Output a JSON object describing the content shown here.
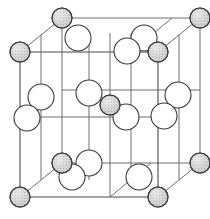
{
  "figure": {
    "title": "Rock-salt (NaCl-type) crystal unit cell",
    "projection": "oblique",
    "background_color": "#ffffff",
    "line_color": "#6e6e6e",
    "outline_color": "#3a3a3a",
    "shaded_atom_fill": "#b5b5b5",
    "open_atom_fill": "#ffffff"
  },
  "chart_data": {
    "type": "scatter",
    "title": "Rock-salt (NaCl-type) crystal unit cell",
    "xlabel": "",
    "ylabel": "",
    "xlim": [
      0,
      210
    ],
    "ylim": [
      0,
      219
    ],
    "grid": false,
    "legend": [
      {
        "name": "shaded-atom",
        "marker": "stippled-circle",
        "color": "#b5b5b5"
      },
      {
        "name": "open-atom",
        "marker": "open-circle",
        "color": "#ffffff"
      }
    ],
    "cube": {
      "front_bottom_left": [
        20,
        197
      ],
      "front_bottom_right": [
        158,
        197
      ],
      "front_top_left": [
        20,
        52
      ],
      "front_top_right": [
        158,
        52
      ],
      "back_bottom_left": [
        62,
        163
      ],
      "back_bottom_right": [
        200,
        163
      ],
      "back_top_left": [
        62,
        18
      ],
      "back_top_right": [
        200,
        18
      ]
    },
    "series": [
      {
        "name": "shaded-atom",
        "radius": 10,
        "points": [
          [
            20,
            52
          ],
          [
            158,
            52
          ],
          [
            20,
            197
          ],
          [
            158,
            197
          ],
          [
            62,
            18
          ],
          [
            200,
            18
          ],
          [
            62,
            163
          ],
          [
            200,
            163
          ],
          [
            110,
            105
          ]
        ]
      },
      {
        "name": "open-atom",
        "radius": 13,
        "points": [
          [
            78,
            38
          ],
          [
            144,
            38
          ],
          [
            128,
            50
          ],
          [
            172,
            118
          ],
          [
            41,
            117
          ],
          [
            89,
            125
          ],
          [
            63,
            131
          ],
          [
            166,
            100
          ],
          [
            89,
            180
          ],
          [
            70,
            193
          ],
          [
            143,
            180
          ],
          [
            89,
            33
          ],
          [
            126,
            116
          ],
          [
            41,
            97
          ]
        ]
      }
    ]
  },
  "atoms": {
    "shaded": [
      {
        "id": "corner-back-top-left",
        "cx": 62,
        "cy": 18,
        "r": 10
      },
      {
        "id": "corner-back-top-right",
        "cx": 200,
        "cy": 18,
        "r": 10
      },
      {
        "id": "corner-front-top-left",
        "cx": 20,
        "cy": 52,
        "r": 10
      },
      {
        "id": "corner-front-top-right",
        "cx": 158,
        "cy": 52,
        "r": 10
      },
      {
        "id": "body-center",
        "cx": 110,
        "cy": 105,
        "r": 10
      },
      {
        "id": "corner-back-bottom-left",
        "cx": 62,
        "cy": 163,
        "r": 10
      },
      {
        "id": "corner-back-bottom-right",
        "cx": 200,
        "cy": 163,
        "r": 10
      },
      {
        "id": "corner-front-bottom-left",
        "cx": 20,
        "cy": 197,
        "r": 10
      },
      {
        "id": "corner-front-bottom-right",
        "cx": 158,
        "cy": 197,
        "r": 10
      }
    ],
    "open": [
      {
        "id": "edge-top-back-mid",
        "cx": 78,
        "cy": 38,
        "r": 13
      },
      {
        "id": "edge-top-right-back",
        "cx": 144,
        "cy": 38,
        "r": 13
      },
      {
        "id": "edge-top-right-front",
        "cx": 127,
        "cy": 51,
        "r": 13
      },
      {
        "id": "face-left-upper",
        "cx": 41,
        "cy": 97,
        "r": 13
      },
      {
        "id": "face-left-lower",
        "cx": 27,
        "cy": 118,
        "r": 13
      },
      {
        "id": "face-center-left",
        "cx": 89,
        "cy": 93,
        "r": 13
      },
      {
        "id": "face-center-right",
        "cx": 126,
        "cy": 117,
        "r": 13
      },
      {
        "id": "face-right-upper",
        "cx": 178,
        "cy": 95,
        "r": 13
      },
      {
        "id": "face-right-lower",
        "cx": 164,
        "cy": 116,
        "r": 13
      },
      {
        "id": "edge-bottom-left-back",
        "cx": 89,
        "cy": 163,
        "r": 13
      },
      {
        "id": "edge-bottom-left-front",
        "cx": 72,
        "cy": 177,
        "r": 13
      },
      {
        "id": "edge-bottom-right-front",
        "cx": 139,
        "cy": 177,
        "r": 13
      }
    ]
  }
}
